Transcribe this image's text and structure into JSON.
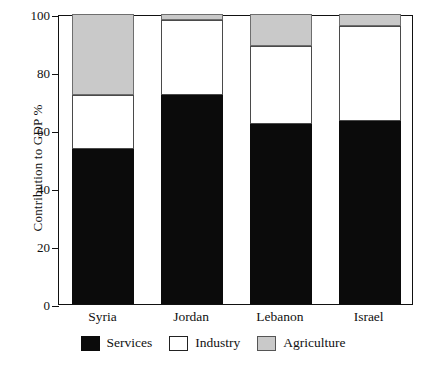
{
  "chart_data": {
    "type": "bar",
    "stacked": true,
    "title": "",
    "xlabel": "",
    "ylabel": "Contribution to GDP %",
    "ylim": [
      0,
      100
    ],
    "yticks": [
      0,
      20,
      40,
      60,
      80,
      100
    ],
    "ytick_labels": [
      "0",
      "20",
      "40",
      "60",
      "80",
      "100"
    ],
    "grid": false,
    "legend_position": "bottom",
    "categories": [
      "Syria",
      "Jordan",
      "Lebanon",
      "Israel"
    ],
    "series": [
      {
        "name": "Services",
        "color": "#0b0b0b",
        "values": [
          53.5,
          72,
          62,
          63
        ]
      },
      {
        "name": "Industry",
        "color": "#ffffff",
        "values": [
          18.5,
          26,
          27,
          33
        ]
      },
      {
        "name": "Agriculture",
        "color": "#c9c9c9",
        "values": [
          28,
          2,
          11,
          4
        ]
      }
    ],
    "segment_tops": {
      "Syria": {
        "services": 53.5,
        "industry": 72,
        "agriculture": 100
      },
      "Jordan": {
        "services": 72,
        "industry": 98,
        "agriculture": 100
      },
      "Lebanon": {
        "services": 62,
        "industry": 89,
        "agriculture": 100
      },
      "Israel": {
        "services": 63,
        "industry": 96,
        "agriculture": 100
      }
    }
  },
  "axis": {
    "y_title": "Contribution to GDP %",
    "ticks": [
      "100",
      "80",
      "60",
      "40",
      "20",
      "0"
    ]
  },
  "categories": [
    {
      "label": "Syria"
    },
    {
      "label": "Jordan"
    },
    {
      "label": "Lebanon"
    },
    {
      "label": "Israel"
    }
  ],
  "legend": [
    {
      "label": "Services",
      "swatch": "services-swatch"
    },
    {
      "label": "Industry",
      "swatch": "industry-swatch"
    },
    {
      "label": "Agriculture",
      "swatch": "agriculture-swatch"
    }
  ]
}
